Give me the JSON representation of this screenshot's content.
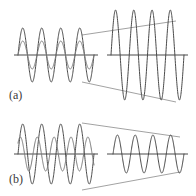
{
  "figure": {
    "type": "signal-waveform-diagram",
    "width": 196,
    "height": 196,
    "background_color": "#ffffff",
    "stroke_color": "#4a4a4a",
    "axis_color": "#4a4a4a",
    "connector_color": "#8a8a8a",
    "label_color": "#3a3a3a"
  },
  "panels": [
    {
      "id": "a",
      "label": "(a)",
      "label_x": 9,
      "label_y": 88,
      "operation": "amplification",
      "connector_shape": "diverging",
      "left": {
        "name": "input-waveform-a",
        "axis_y": 55,
        "axis_x_start": 14,
        "axis_x_end": 98,
        "waves": [
          {
            "name": "large-amplitude-wave",
            "amplitude": 27,
            "cycles": 4,
            "phase_deg": 0,
            "x_start": 18,
            "x_end": 94,
            "stroke": "#4a4a4a",
            "stroke_width": 1
          },
          {
            "name": "small-amplitude-wave",
            "amplitude": 14,
            "cycles": 4,
            "phase_deg": 0,
            "x_start": 18,
            "x_end": 94,
            "stroke": "#7a7a7a",
            "stroke_width": 1
          }
        ]
      },
      "right": {
        "name": "output-waveform-a",
        "axis_y": 55,
        "axis_x_start": 107,
        "axis_x_end": 188,
        "waves": [
          {
            "name": "amplified-wave",
            "amplitude": 45,
            "cycles": 4,
            "phase_deg": 0,
            "x_start": 111,
            "x_end": 184,
            "stroke": "#4a4a4a",
            "stroke_width": 1
          }
        ]
      },
      "connectors": [
        {
          "name": "upper-connector-a",
          "x1": 82,
          "y1": 35,
          "x2": 176,
          "y2": 21
        },
        {
          "name": "lower-connector-a",
          "x1": 82,
          "y1": 82,
          "x2": 176,
          "y2": 102
        }
      ]
    },
    {
      "id": "b",
      "label": "(b)",
      "label_x": 9,
      "label_y": 172,
      "operation": "attenuation",
      "connector_shape": "converging",
      "left": {
        "name": "input-waveform-b",
        "axis_y": 154,
        "axis_x_start": 14,
        "axis_x_end": 98,
        "waves": [
          {
            "name": "large-amplitude-wave",
            "amplitude": 30,
            "cycles": 4,
            "phase_deg": 0,
            "x_start": 18,
            "x_end": 94,
            "stroke": "#4a4a4a",
            "stroke_width": 1
          },
          {
            "name": "small-amplitude-wave",
            "amplitude": 17,
            "cycles": 4.5,
            "phase_deg": 40,
            "x_start": 18,
            "x_end": 94,
            "stroke": "#7a7a7a",
            "stroke_width": 1
          }
        ]
      },
      "right": {
        "name": "output-waveform-b",
        "axis_y": 154,
        "axis_x_start": 107,
        "axis_x_end": 188,
        "waves": [
          {
            "name": "attenuated-wave",
            "amplitude": 19,
            "cycles": 4,
            "phase_deg": 0,
            "x_start": 113,
            "x_end": 184,
            "stroke": "#4a4a4a",
            "stroke_width": 1
          }
        ]
      },
      "connectors": [
        {
          "name": "upper-connector-b",
          "x1": 82,
          "y1": 123,
          "x2": 180,
          "y2": 137
        },
        {
          "name": "lower-connector-b",
          "x1": 82,
          "y1": 190,
          "x2": 180,
          "y2": 172
        }
      ]
    }
  ]
}
